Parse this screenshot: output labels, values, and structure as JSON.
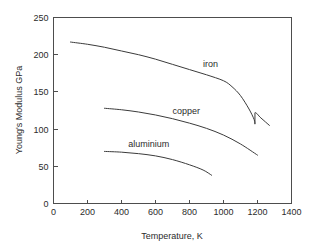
{
  "chart_data": {
    "type": "line",
    "title": "",
    "xlabel": "Temperature, K",
    "ylabel": "Young's Modulus GPa",
    "xlim": [
      0,
      1400
    ],
    "ylim": [
      0,
      250
    ],
    "xticks": [
      0,
      200,
      400,
      600,
      800,
      1000,
      1200,
      1400
    ],
    "yticks": [
      0,
      50,
      100,
      150,
      200,
      250
    ],
    "xtick_labels": [
      "0",
      "200",
      "400",
      "600",
      "800",
      "1000",
      "1200",
      "1400"
    ],
    "ytick_labels": [
      "0",
      "50",
      "100",
      "150",
      "200",
      "250"
    ],
    "grid": false,
    "legend": "inline-labels",
    "line_color": "#3b3b3b",
    "axis_color": "#4d4d4d",
    "background_color": "#ffffff",
    "series": [
      {
        "name": "iron",
        "label": "iron",
        "label_x": 880,
        "label_y": 183,
        "points": [
          [
            100,
            217
          ],
          [
            200,
            214
          ],
          [
            300,
            210
          ],
          [
            400,
            205
          ],
          [
            500,
            200
          ],
          [
            600,
            194
          ],
          [
            700,
            187
          ],
          [
            800,
            180
          ],
          [
            900,
            173
          ],
          [
            1000,
            165
          ],
          [
            1050,
            157
          ],
          [
            1100,
            145
          ],
          [
            1150,
            127
          ],
          [
            1180,
            113
          ],
          [
            1185,
            107
          ],
          [
            1185,
            122
          ],
          [
            1220,
            115
          ],
          [
            1270,
            105
          ]
        ]
      },
      {
        "name": "copper",
        "label": "copper",
        "label_x": 700,
        "label_y": 120,
        "points": [
          [
            300,
            128
          ],
          [
            400,
            126
          ],
          [
            500,
            123
          ],
          [
            600,
            119
          ],
          [
            700,
            114
          ],
          [
            800,
            108
          ],
          [
            900,
            101
          ],
          [
            1000,
            92
          ],
          [
            1100,
            80
          ],
          [
            1200,
            65
          ]
        ]
      },
      {
        "name": "aluminium",
        "label": "aluminium",
        "label_x": 440,
        "label_y": 76,
        "points": [
          [
            300,
            70
          ],
          [
            400,
            69
          ],
          [
            500,
            67
          ],
          [
            600,
            64
          ],
          [
            700,
            59
          ],
          [
            800,
            52
          ],
          [
            880,
            45
          ],
          [
            930,
            38
          ]
        ]
      }
    ]
  }
}
